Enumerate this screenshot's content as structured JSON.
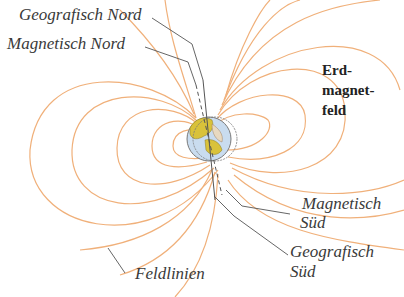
{
  "diagram": {
    "labels": {
      "geographic_north": "Geografisch Nord",
      "magnetic_north": "Magnetisch Nord",
      "field_title_line1": "Erd-",
      "field_title_line2": "magnet-",
      "field_title_line3": "feld",
      "magnetic_south_line1": "Magnetisch",
      "magnetic_south_line2": "Süd",
      "geographic_south_line1": "Geografisch",
      "geographic_south_line2": "Süd",
      "field_lines": "Feldlinien"
    },
    "colors": {
      "field_line": "#f0b07a",
      "leader_line": "#555555",
      "earth_land": "#d9c23a",
      "earth_ocean": "#c9dcef",
      "earth_outline": "#7a7a7a",
      "text": "#3a3a3a"
    }
  }
}
